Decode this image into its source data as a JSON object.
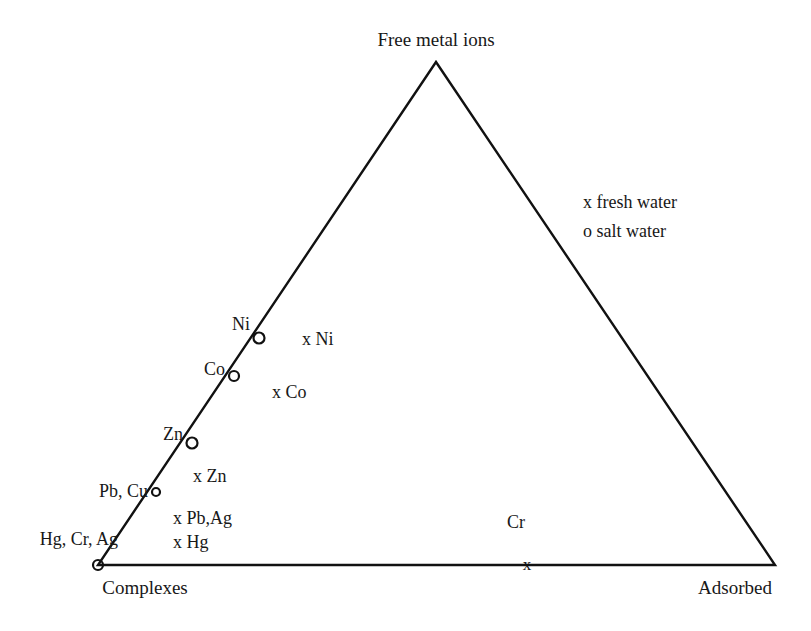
{
  "figure": {
    "type": "ternary-diagram",
    "background_color": "#ffffff",
    "line_color": "#111111",
    "text_color": "#181818"
  },
  "vertices": {
    "top": {
      "label": "Free metal ions",
      "x": 436,
      "y": 62
    },
    "bottom_left": {
      "label": "Complexes",
      "x": 98,
      "y": 565
    },
    "bottom_right": {
      "label": "Adsorbed",
      "x": 775,
      "y": 565
    }
  },
  "legend": {
    "fresh_water": "x fresh water",
    "salt_water": "o salt water"
  },
  "chart_data": {
    "type": "scatter",
    "title": "",
    "subtitle": "",
    "xlabel": "",
    "ylabel": "",
    "axes": [
      "Free metal ions",
      "Complexes",
      "Adsorbed"
    ],
    "legend_position": "upper-right",
    "grid": false,
    "series": [
      {
        "name": "salt water",
        "marker": "o",
        "points": [
          {
            "label": "Ni",
            "x": 259,
            "y": 338,
            "marker_size": 11
          },
          {
            "label": "Co",
            "x": 234,
            "y": 376,
            "marker_size": 10
          },
          {
            "label": "Zn",
            "x": 192,
            "y": 443,
            "marker_size": 11
          },
          {
            "label": "Pb, Cu",
            "x": 156,
            "y": 492,
            "marker_size": 8
          },
          {
            "label": "Hg, Cr, Ag",
            "x": 98,
            "y": 565,
            "marker_size": 10
          }
        ]
      },
      {
        "name": "fresh water",
        "marker": "x",
        "points": [
          {
            "label": "x Ni",
            "x": 302,
            "y": 341
          },
          {
            "label": "x Co",
            "x": 272,
            "y": 393
          },
          {
            "label": "x Zn",
            "x": 193,
            "y": 478
          },
          {
            "label": "x Pb,Ag",
            "x": 175,
            "y": 519
          },
          {
            "label": "x Hg",
            "x": 175,
            "y": 543
          },
          {
            "label": "Cr",
            "x": 527,
            "y": 566
          }
        ]
      }
    ]
  },
  "labels": {
    "apex": "Free metal ions",
    "bottom_left": "Complexes",
    "bottom_right": "Adsorbed",
    "salt_ni": "Ni",
    "salt_co": "Co",
    "salt_zn": "Zn",
    "salt_pbcu": "Pb, Cu",
    "salt_hgcrag": "Hg, Cr, Ag",
    "fresh_ni": "x Ni",
    "fresh_co": "x Co",
    "fresh_zn": "x Zn",
    "fresh_pbag": "x Pb,Ag",
    "fresh_hg": "x Hg",
    "fresh_cr": "Cr",
    "legend_fresh": "x fresh water",
    "legend_salt": "o salt water"
  }
}
